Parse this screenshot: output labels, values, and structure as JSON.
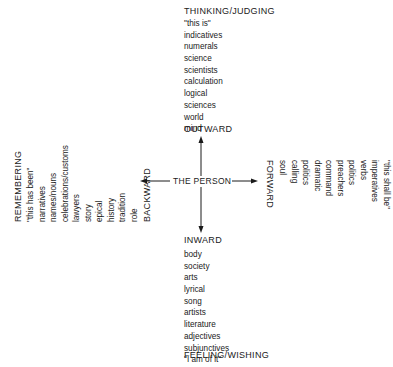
{
  "center": {
    "label": "THE PERSON"
  },
  "top": {
    "heading": "THINKING/JUDGING",
    "direction": "OUTWARD",
    "items": [
      "\"this is\"",
      "indicatives",
      "numerals",
      "science",
      "scientists",
      "calculation",
      "logical",
      "sciences",
      "world",
      "mind"
    ]
  },
  "bottom": {
    "direction": "INWARD",
    "heading": "FEELING/WISHING",
    "items": [
      "body",
      "society",
      "arts",
      "lyrical",
      "song",
      "artists",
      "literature",
      "adjectives",
      "subjunctives",
      "\"I am of it\""
    ]
  },
  "left": {
    "heading": "REMEMBERING",
    "direction": "BACKWARD",
    "items": [
      "\"this has been\"",
      "narratives",
      "names/nouns",
      "celebrations/customs",
      "lawyers",
      "story",
      "epical",
      "history",
      "tradition",
      "role"
    ]
  },
  "right": {
    "direction": "FORWARD",
    "heading": "ANTICIPATING/WILLING",
    "items": [
      "soul",
      "calling",
      "politics",
      "dramatic",
      "command",
      "preachers",
      "politics",
      "verbs",
      "imperatives",
      "\"this shall be\""
    ]
  }
}
